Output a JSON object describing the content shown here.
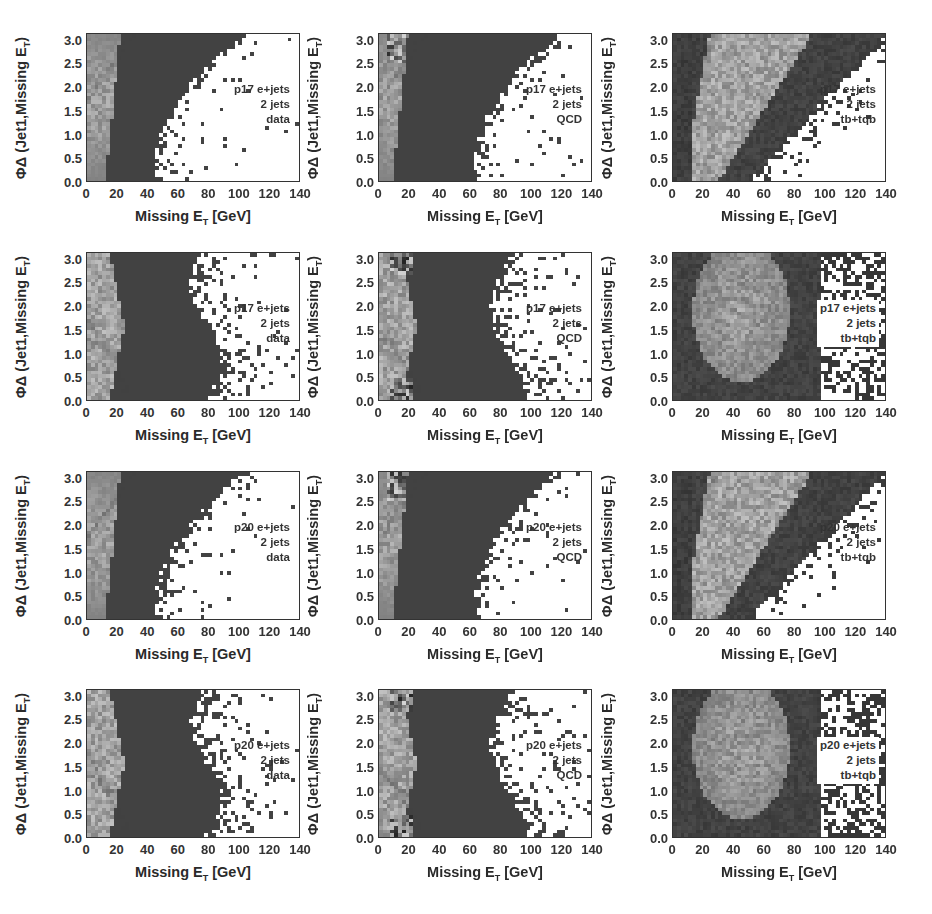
{
  "figure": {
    "x_axis_label": "Missing E",
    "x_axis_label_sub": "T",
    "x_axis_unit": " [GeV]",
    "y_axis_label": "ΦΔ (Jet1,Missing E",
    "y_axis_label_sub": "T",
    "y_axis_label_close": ")",
    "x_ticks": [
      "0",
      "20",
      "40",
      "60",
      "80",
      "100",
      "120",
      "140"
    ],
    "y_ticks": [
      "0.0",
      "0.5",
      "1.0",
      "1.5",
      "2.0",
      "2.5",
      "3.0"
    ]
  },
  "panels": [
    {
      "id": "p17-data-a",
      "row": 0,
      "col": 0,
      "line1": "p17 e+jets",
      "line2": "2 jets",
      "line3": "data",
      "kind": "data1"
    },
    {
      "id": "p17-qcd-a",
      "row": 0,
      "col": 1,
      "line1": "p17 e+jets",
      "line2": "2 jets",
      "line3": "QCD",
      "kind": "qcd1"
    },
    {
      "id": "p17-tb-a",
      "row": 0,
      "col": 2,
      "line1": "p17 e+jets",
      "line2": "2 jets",
      "line3": "tb+tqb",
      "kind": "tb1"
    },
    {
      "id": "p17-data-b",
      "row": 1,
      "col": 0,
      "line1": "p17 e+jets",
      "line2": "2 jets",
      "line3": "data",
      "kind": "data2"
    },
    {
      "id": "p17-qcd-b",
      "row": 1,
      "col": 1,
      "line1": "p17 e+jets",
      "line2": "2 jets",
      "line3": "QCD",
      "kind": "qcd2"
    },
    {
      "id": "p17-tb-b",
      "row": 1,
      "col": 2,
      "line1": "p17 e+jets",
      "line2": "2 jets",
      "line3": "tb+tqb",
      "kind": "tb2"
    },
    {
      "id": "p20-data-a",
      "row": 2,
      "col": 0,
      "line1": "p20 e+jets",
      "line2": "2 jets",
      "line3": "data",
      "kind": "data1"
    },
    {
      "id": "p20-qcd-a",
      "row": 2,
      "col": 1,
      "line1": "p20 e+jets",
      "line2": "2 jets",
      "line3": "QCD",
      "kind": "qcd1"
    },
    {
      "id": "p20-tb-a",
      "row": 2,
      "col": 2,
      "line1": "p20 e+jets",
      "line2": "2 jets",
      "line3": "tb+tqb",
      "kind": "tb1"
    },
    {
      "id": "p20-data-b",
      "row": 3,
      "col": 0,
      "line1": "p20 e+jets",
      "line2": "2 jets",
      "line3": "data",
      "kind": "data2"
    },
    {
      "id": "p20-qcd-b",
      "row": 3,
      "col": 1,
      "line1": "p20 e+jets",
      "line2": "2 jets",
      "line3": "QCD",
      "kind": "qcd2"
    },
    {
      "id": "p20-tb-b",
      "row": 3,
      "col": 2,
      "line1": "p20 e+jets",
      "line2": "2 jets",
      "line3": "tb+tqb",
      "kind": "tb2"
    }
  ],
  "chart_data": [
    {
      "type": "heatmap",
      "title": "p17 e+jets, 2 jets, data",
      "xlabel": "Missing E_T [GeV]",
      "ylabel": "ΦΔ (Jet1, Missing E_T)",
      "xlim": [
        0,
        140
      ],
      "ylim": [
        0,
        3.14
      ],
      "xticks": [
        0,
        20,
        40,
        60,
        80,
        100,
        120,
        140
      ],
      "yticks": [
        0.0,
        0.5,
        1.0,
        1.5,
        2.0,
        2.5,
        3.0
      ],
      "description": "Dense region at low MET (<45 GeV, widening to ~100 GeV near Δφ=3); light band 0-15 GeV with diagonal cut line from (0,1.7) to (25,3.1); sparse above ~60 GeV"
    },
    {
      "type": "heatmap",
      "title": "p17 e+jets, 2 jets, QCD",
      "xlabel": "Missing E_T [GeV]",
      "ylabel": "ΦΔ (Jet1, Missing E_T)",
      "xlim": [
        0,
        140
      ],
      "ylim": [
        0,
        3.14
      ],
      "description": "Dense region to ~65 GeV at low Δφ, extending to ~110 GeV at Δφ=3; light peak near 10-15 GeV at Δφ≈3"
    },
    {
      "type": "heatmap",
      "title": "p17 e+jets, 2 jets, tb+tqb",
      "xlabel": "Missing E_T [GeV]",
      "ylabel": "ΦΔ (Jet1, Missing E_T)",
      "xlim": [
        0,
        140
      ],
      "ylim": [
        0,
        3.14
      ],
      "description": "Light (high-density) diagonal band from 15-30 GeV at low Δφ to 30-80 GeV at high Δφ; dark surrounding region; empty at high MET/low Δφ"
    },
    {
      "type": "heatmap",
      "title": "p17 e+jets, 2 jets, data (alt. cut)",
      "xlabel": "Missing E_T [GeV]",
      "ylabel": "ΦΔ (Jet1, Missing E_T)",
      "xlim": [
        0,
        140
      ],
      "ylim": [
        0,
        3.14
      ],
      "description": "Dense region 0-80 GeV across all Δφ; light band 0-25 GeV with two diagonal cut lines; sparse above ~80-95 GeV"
    },
    {
      "type": "heatmap",
      "title": "p17 e+jets, 2 jets, QCD (alt. cut)",
      "xlabel": "Missing E_T [GeV]",
      "ylabel": "ΦΔ (Jet1, Missing E_T)",
      "xlim": [
        0,
        140
      ],
      "ylim": [
        0,
        3.14
      ],
      "description": "Dense to ~85 GeV; light peaks near 10-20 GeV at Δφ≈0.3 and Δφ≈3"
    },
    {
      "type": "heatmap",
      "title": "p17 e+jets, 2 jets, tb+tqb (alt. cut)",
      "xlabel": "Missing E_T [GeV]",
      "ylabel": "ΦΔ (Jet1, Missing E_T)",
      "xlim": [
        0,
        140
      ],
      "ylim": [
        0,
        3.14
      ],
      "description": "Broad light blob centered ~45 GeV, Δφ≈2 spanning 15-80 GeV; sparse corners at high MET"
    },
    {
      "type": "heatmap",
      "title": "p20 e+jets, 2 jets, data",
      "xlabel": "Missing E_T [GeV]",
      "ylabel": "ΦΔ (Jet1, Missing E_T)",
      "xlim": [
        0,
        140
      ],
      "ylim": [
        0,
        3.14
      ]
    },
    {
      "type": "heatmap",
      "title": "p20 e+jets, 2 jets, QCD",
      "xlabel": "Missing E_T [GeV]",
      "ylabel": "ΦΔ (Jet1, Missing E_T)",
      "xlim": [
        0,
        140
      ],
      "ylim": [
        0,
        3.14
      ]
    },
    {
      "type": "heatmap",
      "title": "p20 e+jets, 2 jets, tb+tqb",
      "xlabel": "Missing E_T [GeV]",
      "ylabel": "ΦΔ (Jet1, Missing E_T)",
      "xlim": [
        0,
        140
      ],
      "ylim": [
        0,
        3.14
      ]
    },
    {
      "type": "heatmap",
      "title": "p20 e+jets, 2 jets, data (alt. cut)",
      "xlabel": "Missing E_T [GeV]",
      "ylabel": "ΦΔ (Jet1, Missing E_T)",
      "xlim": [
        0,
        140
      ],
      "ylim": [
        0,
        3.14
      ]
    },
    {
      "type": "heatmap",
      "title": "p20 e+jets, 2 jets, QCD (alt. cut)",
      "xlabel": "Missing E_T [GeV]",
      "ylabel": "ΦΔ (Jet1, Missing E_T)",
      "xlim": [
        0,
        140
      ],
      "ylim": [
        0,
        3.14
      ]
    },
    {
      "type": "heatmap",
      "title": "p20 e+jets, 2 jets, tb+tqb (alt. cut)",
      "xlabel": "Missing E_T [GeV]",
      "ylabel": "ΦΔ (Jet1, Missing E_T)",
      "xlim": [
        0,
        140
      ],
      "ylim": [
        0,
        3.14
      ]
    }
  ]
}
